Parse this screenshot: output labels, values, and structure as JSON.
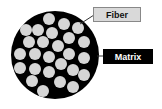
{
  "diagram": {
    "labels": {
      "fiber": "Fiber",
      "matrix": "Matrix"
    },
    "colors": {
      "matrix": "#000000",
      "fiber": "#d6d6d6",
      "fiber_label_bg": "#d9d9d9",
      "matrix_label_bg": "#000000"
    },
    "fiber_count": 26
  }
}
